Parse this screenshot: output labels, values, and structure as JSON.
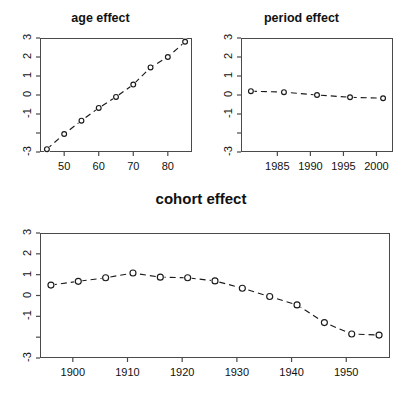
{
  "figure": {
    "kind": "apc-effect-panels",
    "panel_count": 3
  },
  "chart_data": [
    {
      "type": "line",
      "title": "age effect",
      "xlabel": "",
      "ylabel": "",
      "x": [
        45,
        50,
        55,
        60,
        65,
        70,
        75,
        80,
        85
      ],
      "values": [
        -2.85,
        -2.05,
        -1.35,
        -0.68,
        -0.1,
        0.55,
        1.45,
        2.0,
        2.8
      ],
      "xlim": [
        43,
        87
      ],
      "ylim": [
        -3,
        3
      ],
      "xticks": [
        50,
        60,
        70,
        80
      ],
      "xtick_labels": [
        "50",
        "60",
        "70",
        "80"
      ],
      "yticks": [
        3,
        2,
        1,
        0,
        -1,
        -2,
        -3
      ],
      "ytick_labels": [
        "3",
        "2",
        "1",
        "0",
        "-1",
        "",
        "-3"
      ],
      "grid": false,
      "legend": "none",
      "marker": "open-circle",
      "linestyle": "dashed"
    },
    {
      "type": "line",
      "title": "period effect",
      "xlabel": "",
      "ylabel": "",
      "x": [
        1981,
        1986,
        1991,
        1996,
        2001
      ],
      "values": [
        0.2,
        0.15,
        0.0,
        -0.12,
        -0.17
      ],
      "xlim": [
        1979.5,
        2002.5
      ],
      "ylim": [
        -3,
        3
      ],
      "xticks": [
        1985,
        1990,
        1995,
        2000
      ],
      "xtick_labels": [
        "1985",
        "1990",
        "1995",
        "2000"
      ],
      "yticks": [
        3,
        2,
        1,
        0,
        -1,
        -2,
        -3
      ],
      "ytick_labels": [
        "3",
        "2",
        "1",
        "0",
        "-1",
        "",
        "-3"
      ],
      "grid": false,
      "legend": "none",
      "marker": "open-circle",
      "linestyle": "dashed"
    },
    {
      "type": "line",
      "title": "cohort effect",
      "xlabel": "",
      "ylabel": "",
      "x": [
        1896,
        1901,
        1906,
        1911,
        1916,
        1921,
        1926,
        1931,
        1936,
        1941,
        1946,
        1951,
        1956
      ],
      "values": [
        0.5,
        0.68,
        0.85,
        1.08,
        0.88,
        0.85,
        0.7,
        0.35,
        -0.05,
        -0.45,
        -1.3,
        -1.85,
        -1.9
      ],
      "xlim": [
        1894,
        1958
      ],
      "ylim": [
        -3,
        3
      ],
      "xticks": [
        1900,
        1910,
        1920,
        1930,
        1940,
        1950
      ],
      "xtick_labels": [
        "1900",
        "1910",
        "1920",
        "1930",
        "1940",
        "1950"
      ],
      "yticks": [
        3,
        2,
        1,
        0,
        -1,
        -2,
        -3
      ],
      "ytick_labels": [
        "3",
        "2",
        "1",
        "0",
        "-1",
        "",
        "-3"
      ],
      "grid": false,
      "legend": "none",
      "marker": "open-circle",
      "linestyle": "dashed"
    }
  ],
  "colors": {
    "line": "#1a1a1a",
    "axis": "#4a4a4a",
    "text": "#111111",
    "background": "#ffffff"
  }
}
